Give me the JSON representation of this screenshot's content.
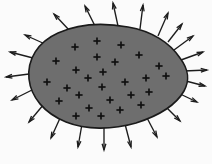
{
  "figure": {
    "title": "Closed surface enclosing positive charge with outward electric field",
    "background_color": "#fbfbfb",
    "surface": {
      "name": "gaussian-surface",
      "fill_color": "#6e6e6e",
      "stroke_color": "#1a1a1a",
      "stroke_width": 1.6,
      "shape": "egg-teardrop",
      "path": "M 128 27 C 152 31 170 43 180 58 C 189 70 190 80 184 91 C 176 105 158 116 136 123 C 112 130 86 130 66 122 C 44 113 31 97 29 79 C 27 59 38 42 58 33 C 80 23 106 23 128 27 Z"
    },
    "charge_symbol": {
      "name": "positive-charge",
      "glyph": "+",
      "color": "#111111",
      "count": 27,
      "arm_length": 3.6
    },
    "charges": [
      {
        "x": 75,
        "y": 47
      },
      {
        "x": 97,
        "y": 41
      },
      {
        "x": 121,
        "y": 45
      },
      {
        "x": 56,
        "y": 61
      },
      {
        "x": 76,
        "y": 70
      },
      {
        "x": 97,
        "y": 57
      },
      {
        "x": 115,
        "y": 62
      },
      {
        "x": 139,
        "y": 55
      },
      {
        "x": 159,
        "y": 66
      },
      {
        "x": 47,
        "y": 82
      },
      {
        "x": 67,
        "y": 88
      },
      {
        "x": 88,
        "y": 78
      },
      {
        "x": 103,
        "y": 72
      },
      {
        "x": 102,
        "y": 87
      },
      {
        "x": 125,
        "y": 82
      },
      {
        "x": 146,
        "y": 78
      },
      {
        "x": 166,
        "y": 76
      },
      {
        "x": 59,
        "y": 101
      },
      {
        "x": 79,
        "y": 95
      },
      {
        "x": 89,
        "y": 108
      },
      {
        "x": 110,
        "y": 100
      },
      {
        "x": 131,
        "y": 95
      },
      {
        "x": 149,
        "y": 92
      },
      {
        "x": 76,
        "y": 116
      },
      {
        "x": 101,
        "y": 116
      },
      {
        "x": 120,
        "y": 110
      },
      {
        "x": 141,
        "y": 105
      }
    ],
    "field": {
      "name": "electric-field-lines",
      "direction": "outward",
      "color": "#1c1c1c",
      "arrow_count": 22,
      "head_length": 6.5,
      "head_half_angle_deg": 17
    },
    "arrows": [
      {
        "x1": 118,
        "y1": 26,
        "x2": 113,
        "y2": 3
      },
      {
        "x1": 140,
        "y1": 29,
        "x2": 143,
        "y2": 5
      },
      {
        "x1": 158,
        "y1": 36,
        "x2": 168,
        "y2": 13
      },
      {
        "x1": 95,
        "y1": 26,
        "x2": 85,
        "y2": 6
      },
      {
        "x1": 70,
        "y1": 31,
        "x2": 54,
        "y2": 14
      },
      {
        "x1": 45,
        "y1": 44,
        "x2": 25,
        "y2": 35
      },
      {
        "x1": 33,
        "y1": 58,
        "x2": 10,
        "y2": 52
      },
      {
        "x1": 29,
        "y1": 74,
        "x2": 6,
        "y2": 77
      },
      {
        "x1": 32,
        "y1": 90,
        "x2": 12,
        "y2": 100
      },
      {
        "x1": 44,
        "y1": 104,
        "x2": 29,
        "y2": 122
      },
      {
        "x1": 61,
        "y1": 116,
        "x2": 51,
        "y2": 138
      },
      {
        "x1": 82,
        "y1": 124,
        "x2": 78,
        "y2": 147
      },
      {
        "x1": 104,
        "y1": 127,
        "x2": 104,
        "y2": 150
      },
      {
        "x1": 125,
        "y1": 124,
        "x2": 131,
        "y2": 147
      },
      {
        "x1": 146,
        "y1": 116,
        "x2": 157,
        "y2": 137
      },
      {
        "x1": 164,
        "y1": 105,
        "x2": 180,
        "y2": 121
      },
      {
        "x1": 176,
        "y1": 92,
        "x2": 197,
        "y2": 102
      },
      {
        "x1": 182,
        "y1": 80,
        "x2": 205,
        "y2": 86
      },
      {
        "x1": 184,
        "y1": 71,
        "x2": 207,
        "y2": 70
      },
      {
        "x1": 181,
        "y1": 60,
        "x2": 203,
        "y2": 52
      },
      {
        "x1": 174,
        "y1": 50,
        "x2": 193,
        "y2": 36
      },
      {
        "x1": 168,
        "y1": 42,
        "x2": 182,
        "y2": 24
      }
    ]
  }
}
